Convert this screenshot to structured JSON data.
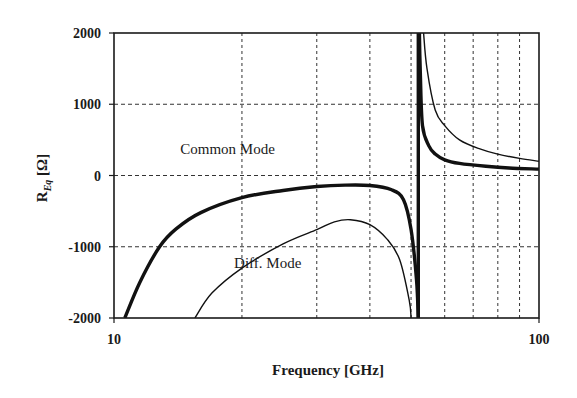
{
  "chart_data": {
    "type": "line",
    "title": "",
    "xlabel": "Frequency [GHz]",
    "ylabel": "R_Eq [Ω]",
    "ylabel_main": "R",
    "ylabel_sub": "Eq",
    "ylabel_unit": " [Ω]",
    "xscale": "log",
    "xlim": [
      10,
      100
    ],
    "ylim": [
      -2000,
      2000
    ],
    "x_ticks": [
      {
        "value": 10,
        "label": "10"
      },
      {
        "value": 100,
        "label": "100"
      }
    ],
    "y_ticks": [
      {
        "value": 2000,
        "label": "2000"
      },
      {
        "value": 1000,
        "label": "1000"
      },
      {
        "value": 0,
        "label": "0"
      },
      {
        "value": -1000,
        "label": "-1000"
      },
      {
        "value": -2000,
        "label": "-2000"
      }
    ],
    "grid": {
      "on": true,
      "style": "dashed",
      "x_minor": [
        20,
        30,
        40,
        50,
        60,
        70,
        80,
        90
      ],
      "y": [
        1000,
        0,
        -1000
      ]
    },
    "legend": null,
    "annotations": [
      {
        "text": "Common Mode",
        "x": 18.5,
        "y": 300
      },
      {
        "text": "Diff. Mode",
        "x": 23,
        "y": -1300
      }
    ],
    "resonance_ghz": 52,
    "series": [
      {
        "name": "Common Mode",
        "style": "thick",
        "segments": [
          [
            [
              10.6,
              -2000
            ],
            [
              11.5,
              -1500
            ],
            [
              12.8,
              -1000
            ],
            [
              14,
              -750
            ],
            [
              16,
              -520
            ],
            [
              20,
              -310
            ],
            [
              25,
              -210
            ],
            [
              30,
              -155
            ],
            [
              35,
              -135
            ],
            [
              40,
              -140
            ],
            [
              45,
              -200
            ],
            [
              48,
              -340
            ],
            [
              50,
              -760
            ],
            [
              51.5,
              -1460
            ],
            [
              52,
              -2000
            ]
          ],
          [
            [
              52.3,
              2000
            ],
            [
              52.6,
              1400
            ],
            [
              53.2,
              700
            ],
            [
              55,
              420
            ],
            [
              57,
              300
            ],
            [
              60,
              220
            ],
            [
              65,
              170
            ],
            [
              75,
              130
            ],
            [
              85,
              105
            ],
            [
              100,
              90
            ]
          ]
        ]
      },
      {
        "name": "Diff. Mode",
        "style": "thin",
        "segments": [
          [
            [
              15.5,
              -2000
            ],
            [
              17,
              -1650
            ],
            [
              20,
              -1300
            ],
            [
              25,
              -960
            ],
            [
              30,
              -760
            ],
            [
              33,
              -650
            ],
            [
              36,
              -620
            ],
            [
              40,
              -690
            ],
            [
              44,
              -900
            ],
            [
              47,
              -1180
            ],
            [
              49.5,
              -1750
            ],
            [
              50,
              -2000
            ]
          ],
          [
            [
              53.5,
              2000
            ],
            [
              54.5,
              1500
            ],
            [
              57,
              920
            ],
            [
              60,
              700
            ],
            [
              65,
              500
            ],
            [
              72,
              380
            ],
            [
              80,
              300
            ],
            [
              90,
              240
            ],
            [
              100,
              200
            ]
          ]
        ]
      }
    ]
  }
}
